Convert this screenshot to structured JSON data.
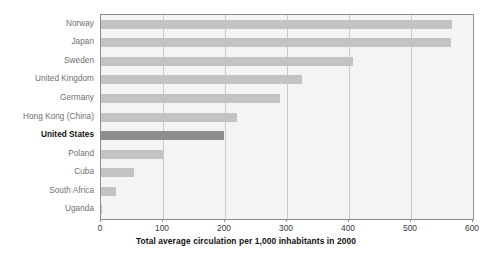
{
  "chart_data": {
    "type": "bar",
    "orientation": "horizontal",
    "title": "",
    "subtitle": "",
    "xlabel": "Total average circulation per 1,000 inhabitants in 2000",
    "ylabel": "",
    "xlim": [
      0,
      600
    ],
    "xticks": [
      0,
      100,
      200,
      300,
      400,
      500,
      600
    ],
    "xtick_labels": [
      "0",
      "100",
      "200",
      "300",
      "400",
      "500",
      "600"
    ],
    "grid": true,
    "grid_axis": "x",
    "legend": false,
    "legend_position": "none",
    "categories": [
      "Norway",
      "Japan",
      "Sweden",
      "United Kingdom",
      "Germany",
      "Hong Kong (China)",
      "United States",
      "Poland",
      "Cuba",
      "South Africa",
      "Uganda"
    ],
    "values": [
      566,
      565,
      406,
      324,
      288,
      219,
      199,
      100,
      53,
      24,
      2
    ],
    "highlight_category": "United States",
    "colors": {
      "bar": "#c3c3c3",
      "bar_highlight": "#8e8e8e",
      "plot_background": "#f4f4f4",
      "grid": "#c9c9c9",
      "axis": "#8d8d8d",
      "label_text": "#6e6e6e",
      "highlight_text": "#111111",
      "tick_text": "#3a3a3a",
      "page_background": "#ffffff"
    }
  }
}
